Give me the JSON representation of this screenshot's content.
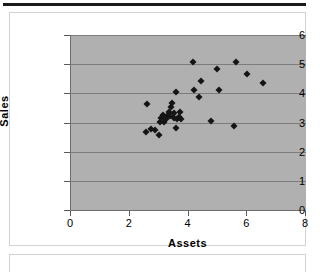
{
  "page": {
    "background_color": "#ffffff",
    "top_rule_color": "#1a1a1a",
    "frame_border_color": "#d2d2d2"
  },
  "chart_frame": {
    "name": "chart-container"
  },
  "lower_frame": {
    "name": "empty-content-box"
  },
  "chart_data": {
    "type": "scatter",
    "title": "",
    "xlabel": "Assets",
    "ylabel": "Sales",
    "xlim": [
      0,
      8
    ],
    "ylim": [
      0,
      6
    ],
    "xticks": [
      0,
      2,
      4,
      6,
      8
    ],
    "yticks": [
      0,
      1,
      2,
      3,
      4,
      5,
      6
    ],
    "xtick_labels": [
      "0",
      "2",
      "4",
      "6",
      "8"
    ],
    "ytick_labels": [
      "0",
      "1",
      "2",
      "3",
      "4",
      "5",
      "6"
    ],
    "grid": "horizontal",
    "legend": "none",
    "plot_background_color": "#b0b0b0",
    "gridline_color": "#7d7d7d",
    "marker_color": "#141414",
    "marker_shape": "diamond",
    "points": [
      {
        "x": 2.58,
        "y": 3.63
      },
      {
        "x": 2.57,
        "y": 2.69
      },
      {
        "x": 2.72,
        "y": 2.77
      },
      {
        "x": 2.86,
        "y": 2.75
      },
      {
        "x": 2.98,
        "y": 2.57
      },
      {
        "x": 3.02,
        "y": 3.02
      },
      {
        "x": 3.08,
        "y": 3.16
      },
      {
        "x": 3.12,
        "y": 3.27
      },
      {
        "x": 3.18,
        "y": 3.02
      },
      {
        "x": 3.24,
        "y": 3.13
      },
      {
        "x": 3.27,
        "y": 3.22
      },
      {
        "x": 3.33,
        "y": 3.37
      },
      {
        "x": 3.38,
        "y": 3.24
      },
      {
        "x": 3.42,
        "y": 3.52
      },
      {
        "x": 3.45,
        "y": 3.68
      },
      {
        "x": 3.49,
        "y": 3.31
      },
      {
        "x": 3.52,
        "y": 3.15
      },
      {
        "x": 3.56,
        "y": 2.82
      },
      {
        "x": 3.58,
        "y": 4.05
      },
      {
        "x": 3.62,
        "y": 3.12
      },
      {
        "x": 3.66,
        "y": 3.19
      },
      {
        "x": 3.72,
        "y": 3.37
      },
      {
        "x": 3.74,
        "y": 3.12
      },
      {
        "x": 4.16,
        "y": 5.07
      },
      {
        "x": 4.18,
        "y": 4.1
      },
      {
        "x": 4.36,
        "y": 3.87
      },
      {
        "x": 4.42,
        "y": 4.44
      },
      {
        "x": 4.78,
        "y": 3.04
      },
      {
        "x": 4.98,
        "y": 4.85
      },
      {
        "x": 5.04,
        "y": 4.13
      },
      {
        "x": 5.55,
        "y": 2.88
      },
      {
        "x": 5.62,
        "y": 5.07
      },
      {
        "x": 5.98,
        "y": 4.68
      },
      {
        "x": 6.55,
        "y": 4.37
      }
    ]
  }
}
